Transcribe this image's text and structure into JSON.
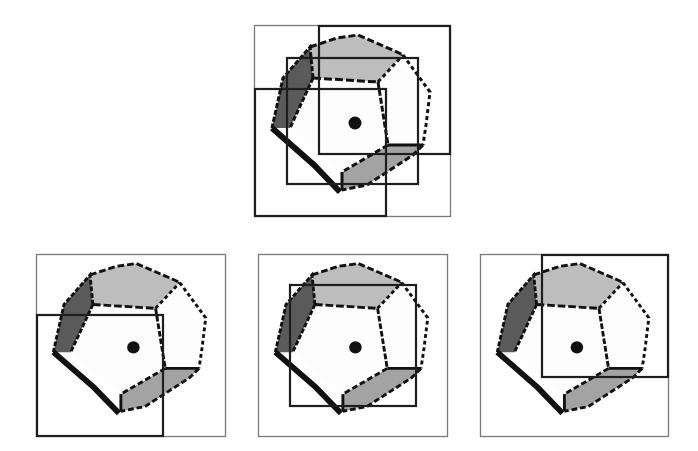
{
  "figure": {
    "colors": {
      "background": "#ffffff",
      "frame": "#7a7a7a",
      "window": "#1e1e1e",
      "outline": "#111111",
      "face_light": "#bdbdbd",
      "face_mid": "#a3a3a3",
      "face_dark": "#5a5a5a",
      "face_white": "#fdfdfd",
      "center_dot": "#111111"
    },
    "panels": [
      {
        "id": "top-composite",
        "frame": {
          "x": 254,
          "y": 25,
          "w": 197,
          "h": 192
        },
        "windows": [
          {
            "name": "upper-right-window",
            "x": 64,
            "y": 0,
            "w": 133,
            "h": 130
          },
          {
            "name": "center-window",
            "x": 32,
            "y": 32,
            "w": 133,
            "h": 128
          },
          {
            "name": "lower-left-window",
            "x": 0,
            "y": 63,
            "w": 133,
            "h": 129
          }
        ]
      },
      {
        "id": "bottom-left-view",
        "frame": {
          "x": 36,
          "y": 254,
          "w": 190,
          "h": 183
        },
        "windows": [
          {
            "name": "lower-left-window",
            "x": 0,
            "y": 60,
            "w": 128,
            "h": 123
          }
        ]
      },
      {
        "id": "bottom-center-view",
        "frame": {
          "x": 258,
          "y": 254,
          "w": 190,
          "h": 183
        },
        "windows": [
          {
            "name": "center-window",
            "x": 31,
            "y": 30,
            "w": 128,
            "h": 123
          }
        ]
      },
      {
        "id": "bottom-right-view",
        "frame": {
          "x": 480,
          "y": 254,
          "w": 189,
          "h": 183
        },
        "windows": [
          {
            "name": "upper-right-window",
            "x": 61,
            "y": 0,
            "w": 128,
            "h": 124
          }
        ]
      }
    ]
  }
}
